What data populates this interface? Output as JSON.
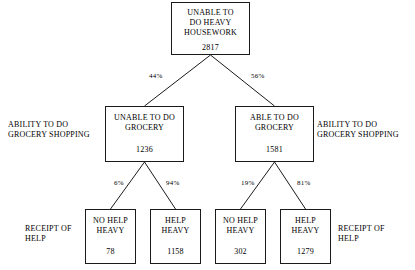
{
  "diagram": {
    "type": "decision-tree",
    "title": "",
    "nodes": {
      "root": {
        "label": "UNABLE TO\nDO HEAVY\nHOUSEWORK",
        "value": "2817"
      },
      "mid_left": {
        "label": "UNABLE TO DO\nGROCERY",
        "value": "1236"
      },
      "mid_right": {
        "label": "ABLE TO DO\nGROCERY",
        "value": "1581"
      },
      "leaf_1": {
        "label": "NO HELP\nHEAVY",
        "value": "78"
      },
      "leaf_2": {
        "label": "HELP\nHEAVY",
        "value": "1158"
      },
      "leaf_3": {
        "label": "NO HELP\nHEAVY",
        "value": "302"
      },
      "leaf_4": {
        "label": "HELP\nHEAVY",
        "value": "1279"
      }
    },
    "edge_labels": {
      "root_to_left": "44%",
      "root_to_right": "56%",
      "left_to_leaf1": "6%",
      "left_to_leaf2": "94%",
      "right_to_leaf3": "19%",
      "right_to_leaf4": "81%"
    },
    "annotations": {
      "grocery_left": "ABILITY TO DO\nGROCERY SHOPPING",
      "grocery_right": "ABILITY TO DO\nGROCERY SHOPPING",
      "help_left": "RECEIPT OF\nHELP",
      "help_right": "RECEIPT OF\nHELP"
    },
    "colors": {
      "line": "#1a1a1a",
      "text": "#000000",
      "background": "#ffffff"
    }
  }
}
